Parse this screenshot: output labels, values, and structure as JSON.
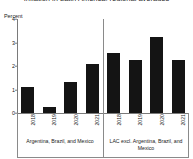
{
  "chart_data": {
    "type": "bar",
    "title": "Inflation in Latin America, regional averages",
    "ylabel": "Percent",
    "xlabel": "",
    "ylim": [
      0,
      4
    ],
    "yticks": [
      "0",
      "1",
      "2",
      "3",
      "4"
    ],
    "grid": false,
    "legend": "none",
    "bar_color": "#141414",
    "axis_color": "#8a8a8a",
    "categories": [
      "2018",
      "2019",
      "2020",
      "2021"
    ],
    "groups": [
      {
        "label": "Argentina, Brazil, and Mexico",
        "categories": [
          "2018",
          "2019",
          "2020",
          "2021"
        ],
        "values": [
          1.1,
          0.27,
          1.35,
          2.1
        ]
      },
      {
        "label": "LAC excl. Argentina, Brazil, and Mexico",
        "categories": [
          "2018",
          "2019",
          "2020",
          "2021"
        ],
        "values": [
          2.55,
          2.27,
          3.25,
          2.25
        ]
      }
    ],
    "series": [
      {
        "name": "Argentina, Brazil, and Mexico",
        "values": [
          1.1,
          0.27,
          1.35,
          2.1
        ]
      },
      {
        "name": "LAC excl. Argentina, Brazil, and Mexico",
        "values": [
          2.55,
          2.27,
          3.25,
          2.25
        ]
      }
    ]
  }
}
